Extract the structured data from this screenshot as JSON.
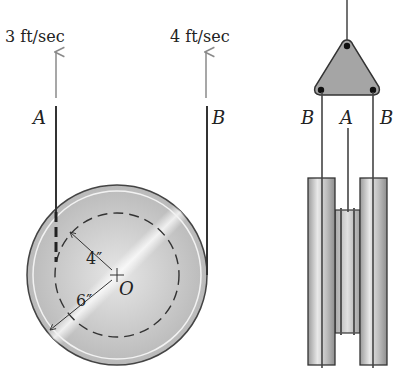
{
  "figure": {
    "front_view": {
      "rope_a": {
        "label": "A",
        "velocity_label": "3 ft/sec"
      },
      "rope_b": {
        "label": "B",
        "velocity_label": "4 ft/sec"
      },
      "center_label": "O",
      "inner_radius_label": "4″",
      "outer_radius_label": "6″"
    },
    "side_view": {
      "left_rope_label": "B",
      "center_rope_label": "A",
      "right_rope_label": "B"
    },
    "colors": {
      "background": "#ffffff",
      "line": "#333333",
      "arrow": "#8a8a8a",
      "pulley_fill": "#c8c8c8",
      "triangle_fill": "#a5a5a5"
    }
  }
}
